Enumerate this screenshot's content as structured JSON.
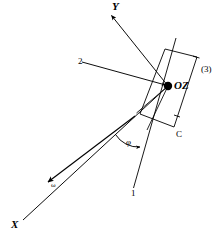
{
  "figure": {
    "type": "vector-line-diagram",
    "background_color": "#ffffff",
    "stroke_color": "#000000",
    "labels": {
      "axis_y": "Y",
      "axis_x": "X",
      "point_oz": "OZ",
      "corner_c": "C",
      "bracket_3": "(3)",
      "ray_1": "1",
      "ray_2": "2",
      "angle_phi": "φ",
      "vector_omega": "ω"
    },
    "geometry": {
      "origin_dot": {
        "x": 168,
        "y": 86,
        "r": 4.2
      },
      "rectangle_corners": [
        {
          "x": 165,
          "y": 49
        },
        {
          "x": 197,
          "y": 57
        },
        {
          "x": 174,
          "y": 127
        },
        {
          "x": 140,
          "y": 114
        }
      ],
      "axis_y_line": {
        "x1": 168,
        "y1": 86,
        "x2": 110,
        "y2": 14
      },
      "axis_x_line": {
        "x1": 168,
        "y1": 86,
        "x2": 23,
        "y2": 219
      },
      "omega_arrow_tip": {
        "x": 47,
        "y": 183
      },
      "ray_1_line": {
        "x1": 176,
        "y1": 38,
        "x2": 133,
        "y2": 190
      },
      "ray_2_line": {
        "x1": 82,
        "y1": 62,
        "x2": 168,
        "y2": 86
      },
      "inner_line_a": {
        "x1": 168,
        "y1": 86,
        "x2": 136,
        "y2": 113
      },
      "inner_line_b": {
        "x1": 168,
        "y1": 86,
        "x2": 146,
        "y2": 128
      },
      "arc_phi": {
        "cx": 137,
        "cy": 114,
        "r": 30,
        "from_deg": 42,
        "to_deg": 78
      }
    }
  }
}
